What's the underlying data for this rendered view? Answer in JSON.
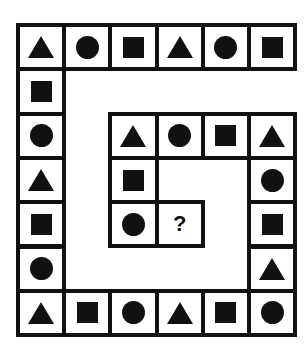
{
  "puzzle": {
    "question_mark": "?",
    "cells": [
      {
        "r": 0,
        "c": 0,
        "shape": "triangle"
      },
      {
        "r": 0,
        "c": 1,
        "shape": "circle"
      },
      {
        "r": 0,
        "c": 2,
        "shape": "square"
      },
      {
        "r": 0,
        "c": 3,
        "shape": "triangle"
      },
      {
        "r": 0,
        "c": 4,
        "shape": "circle"
      },
      {
        "r": 0,
        "c": 5,
        "shape": "square"
      },
      {
        "r": 1,
        "c": 0,
        "shape": "square"
      },
      {
        "r": 2,
        "c": 0,
        "shape": "circle"
      },
      {
        "r": 2,
        "c": 2,
        "shape": "triangle"
      },
      {
        "r": 2,
        "c": 3,
        "shape": "circle"
      },
      {
        "r": 2,
        "c": 4,
        "shape": "square"
      },
      {
        "r": 2,
        "c": 5,
        "shape": "triangle"
      },
      {
        "r": 3,
        "c": 0,
        "shape": "triangle"
      },
      {
        "r": 3,
        "c": 2,
        "shape": "square"
      },
      {
        "r": 3,
        "c": 5,
        "shape": "circle"
      },
      {
        "r": 4,
        "c": 0,
        "shape": "square"
      },
      {
        "r": 4,
        "c": 2,
        "shape": "circle"
      },
      {
        "r": 4,
        "c": 3,
        "shape": "question"
      },
      {
        "r": 4,
        "c": 5,
        "shape": "square"
      },
      {
        "r": 5,
        "c": 0,
        "shape": "circle"
      },
      {
        "r": 5,
        "c": 5,
        "shape": "triangle"
      },
      {
        "r": 6,
        "c": 0,
        "shape": "triangle"
      },
      {
        "r": 6,
        "c": 1,
        "shape": "square"
      },
      {
        "r": 6,
        "c": 2,
        "shape": "circle"
      },
      {
        "r": 6,
        "c": 3,
        "shape": "triangle"
      },
      {
        "r": 6,
        "c": 4,
        "shape": "square"
      },
      {
        "r": 6,
        "c": 5,
        "shape": "circle"
      }
    ]
  }
}
